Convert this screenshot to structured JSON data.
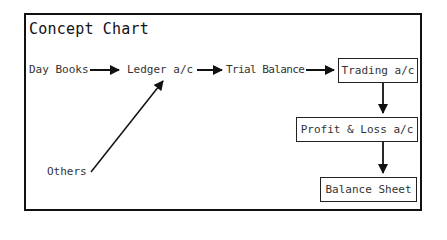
{
  "title": "Concept Chart",
  "nodes": {
    "day_books": "Day Books",
    "ledger": "Ledger a/c",
    "trial_balance": "Trial Balance",
    "trading": "Trading a/c",
    "profit_loss": "Profit & Loss a/c",
    "balance_sheet": "Balance Sheet",
    "others": "Others"
  },
  "edges": [
    {
      "from": "Day Books",
      "to": "Ledger a/c"
    },
    {
      "from": "Others",
      "to": "Ledger a/c"
    },
    {
      "from": "Ledger a/c",
      "to": "Trial Balance"
    },
    {
      "from": "Trial Balance",
      "to": "Trading a/c"
    },
    {
      "from": "Trading a/c",
      "to": "Profit & Loss a/c"
    },
    {
      "from": "Profit & Loss a/c",
      "to": "Balance Sheet"
    }
  ]
}
